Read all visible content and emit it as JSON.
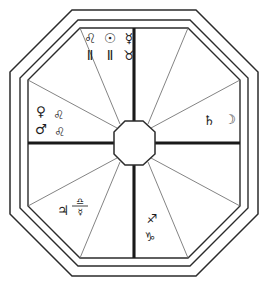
{
  "figure": {
    "background_color": "#ffffff",
    "ink_color": "#2b2b2b",
    "minor_line_color": "#6d6d6d"
  },
  "frame": {
    "outer_label": "outer octagon border",
    "inner_label": "inner octagon border"
  },
  "hub": {
    "label": "central octagon hub"
  },
  "sectors": [
    {
      "id": "north",
      "position": "top",
      "rows": [
        {
          "glyphs": [
            "♌",
            "☉",
            "☿"
          ],
          "names": [
            "leo",
            "sun",
            "mercury"
          ]
        },
        {
          "glyphs": [
            "Ⅱ",
            "Ⅱ",
            "♉"
          ],
          "names": [
            "gemini",
            "gemini",
            "taurus"
          ]
        }
      ]
    },
    {
      "id": "west",
      "position": "left",
      "rows": [
        {
          "glyphs": [
            "♀",
            "♌"
          ],
          "names": [
            "venus",
            "leo"
          ]
        },
        {
          "glyphs": [
            "♂",
            "♌"
          ],
          "names": [
            "mars",
            "leo"
          ]
        }
      ]
    },
    {
      "id": "east",
      "position": "right",
      "rows": [
        {
          "glyphs": [
            "♄",
            "☽"
          ],
          "names": [
            "saturn",
            "moon"
          ]
        }
      ]
    },
    {
      "id": "southwest",
      "position": "bottom-left",
      "rows": [
        {
          "glyphs": [
            "♃"
          ],
          "names": [
            "jupiter"
          ]
        }
      ],
      "stacked": {
        "top": "♎",
        "bottom": "☿",
        "top_name": "libra",
        "bottom_name": "mercury"
      }
    },
    {
      "id": "south",
      "position": "bottom-center",
      "rows": [
        {
          "glyphs": [
            "♐"
          ],
          "names": [
            "sagittarius"
          ]
        },
        {
          "glyphs": [
            "♑"
          ],
          "names": [
            "capricorn"
          ]
        }
      ]
    }
  ],
  "glyphs": {
    "north_r1_c1": "♌",
    "north_r1_c2": "☉",
    "north_r1_c3": "☿",
    "north_r2_c1": "Ⅱ",
    "north_r2_c2": "Ⅱ",
    "north_r2_c3": "♉",
    "west_r1_c1": "♀",
    "west_r1_c2": "♌",
    "west_r2_c1": "♂",
    "west_r2_c2": "♌",
    "east_r1_c1": "♄",
    "east_r1_c2": "☽",
    "southwest_jupiter": "♃",
    "southwest_stack_top": "♎",
    "southwest_stack_bottom": "☿",
    "south_r1": "♐",
    "south_r2": "♑"
  }
}
